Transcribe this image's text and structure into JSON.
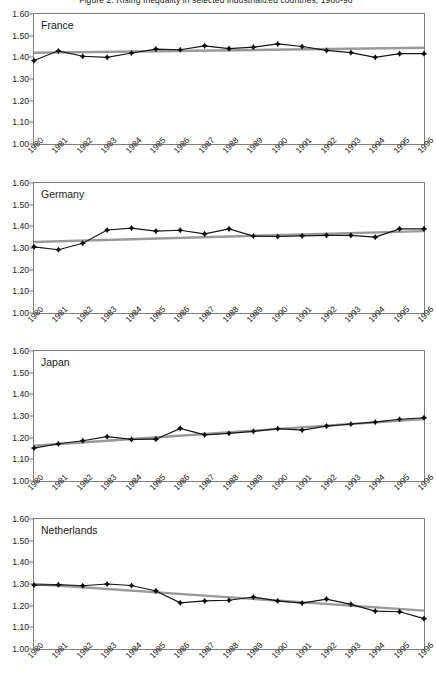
{
  "chart_data": {
    "type": "line",
    "title": "Figure 2. Rising Inequality in selected industrialized countries, 1980-96",
    "xlabel": "",
    "ylabel": "",
    "ylim": [
      1.0,
      1.6
    ],
    "yticks": [
      "1.00",
      "1.10",
      "1.20",
      "1.30",
      "1.40",
      "1.50",
      "1.60"
    ],
    "grid": false,
    "legend": "none",
    "x": [
      1980,
      1981,
      1982,
      1983,
      1984,
      1985,
      1986,
      1987,
      1988,
      1989,
      1990,
      1991,
      1992,
      1993,
      1994,
      1995,
      1996
    ],
    "xticklabels": [
      "1980",
      "1981",
      "1982",
      "1983",
      "1984",
      "1985",
      "1986",
      "1987",
      "1988",
      "1989",
      "1990",
      "1991",
      "1992",
      "1993",
      "1994",
      "1995",
      "1996"
    ],
    "panels": [
      {
        "label": "France",
        "series": [
          {
            "name": "France earnings ratio",
            "marker": "diamond",
            "color": "#111111",
            "x": [
              1980,
              1981,
              1982,
              1983,
              1984,
              1985,
              1986,
              1987,
              1988,
              1989,
              1990,
              1991,
              1992,
              1993,
              1994,
              1995,
              1996
            ],
            "values": [
              1.385,
              1.43,
              1.405,
              1.4,
              1.42,
              1.438,
              1.435,
              1.453,
              1.44,
              1.447,
              1.462,
              1.45,
              1.432,
              1.422,
              1.4,
              1.417,
              1.417
            ]
          },
          {
            "name": "France trend",
            "marker": "none",
            "color": "#9a9a9a",
            "trend_endpoints": [
              1.421,
              1.444
            ]
          }
        ]
      },
      {
        "label": "Germany",
        "series": [
          {
            "name": "Germany earnings ratio",
            "marker": "diamond",
            "color": "#111111",
            "x": [
              1980,
              1981,
              1982,
              1983,
              1984,
              1985,
              1986,
              1987,
              1988,
              1989,
              1990,
              1991,
              1992,
              1993,
              1994,
              1995,
              1996
            ],
            "values": [
              1.305,
              1.292,
              1.322,
              1.383,
              1.392,
              1.378,
              1.382,
              1.365,
              1.388,
              1.355,
              1.353,
              1.356,
              1.358,
              1.358,
              1.35,
              1.388,
              1.388
            ]
          },
          {
            "name": "Germany trend",
            "marker": "none",
            "color": "#9a9a9a",
            "trend_endpoints": [
              1.328,
              1.378
            ]
          }
        ]
      },
      {
        "label": "Japan",
        "series": [
          {
            "name": "Japan earnings ratio",
            "marker": "diamond",
            "color": "#111111",
            "x": [
              1980,
              1981,
              1982,
              1983,
              1984,
              1985,
              1986,
              1987,
              1988,
              1989,
              1990,
              1991,
              1992,
              1993,
              1994,
              1995,
              1996
            ],
            "values": [
              1.152,
              1.172,
              1.186,
              1.205,
              1.192,
              1.193,
              1.243,
              1.213,
              1.22,
              1.229,
              1.242,
              1.235,
              1.253,
              1.263,
              1.272,
              1.285,
              1.292
            ]
          },
          {
            "name": "Japan trend",
            "marker": "none",
            "color": "#9a9a9a",
            "trend_endpoints": [
              1.163,
              1.286
            ]
          }
        ]
      },
      {
        "label": "Netherlands",
        "series": [
          {
            "name": "Netherlands earnings ratio",
            "marker": "diamond",
            "color": "#111111",
            "x": [
              1980,
              1981,
              1982,
              1983,
              1984,
              1985,
              1986,
              1987,
              1988,
              1989,
              1990,
              1991,
              1992,
              1993,
              1994,
              1995,
              1996
            ],
            "values": [
              1.295,
              1.297,
              1.292,
              1.3,
              1.293,
              1.268,
              1.213,
              1.222,
              1.225,
              1.24,
              1.222,
              1.212,
              1.23,
              1.206,
              1.175,
              1.172,
              1.14
            ]
          },
          {
            "name": "Netherlands trend",
            "marker": "none",
            "color": "#9a9a9a",
            "trend_endpoints": [
              1.3,
              1.177
            ]
          }
        ]
      }
    ]
  }
}
